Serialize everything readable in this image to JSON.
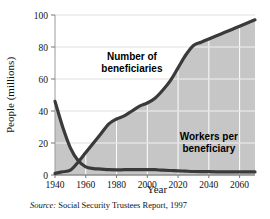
{
  "figure": {
    "source_prefix": "Source:",
    "source_text": "Social Security Trustees Report, 1997"
  },
  "colors": {
    "line": "#3a3a3a",
    "fill": "#c6c6c6",
    "grid": "#ffffff",
    "axis": "#9a9a9a",
    "text": "#111111"
  },
  "chart_data": {
    "type": "area",
    "title": "",
    "xlabel": "Year",
    "ylabel": "People (millions)",
    "xlim": [
      1940,
      2070
    ],
    "ylim": [
      0,
      100
    ],
    "xticks": [
      1940,
      1960,
      1980,
      2000,
      2020,
      2040,
      2060
    ],
    "yticks": [
      0,
      20,
      40,
      60,
      80,
      100
    ],
    "grid": true,
    "legend_position": "inline-annotations",
    "annotations": [
      {
        "text": "Number of beneficiaries",
        "line1": "Number of",
        "line2": "beneficiaries",
        "x": 1990,
        "y": 72
      },
      {
        "text": "Workers per beneficiary",
        "line1": "Workers per",
        "line2": "beneficiary",
        "x": 2040,
        "y": 22
      }
    ],
    "series": [
      {
        "name": "Number of beneficiaries",
        "x": [
          1940,
          1945,
          1950,
          1955,
          1960,
          1965,
          1970,
          1975,
          1980,
          1985,
          1990,
          1995,
          2000,
          2005,
          2010,
          2015,
          2020,
          2025,
          2030,
          2035,
          2040,
          2045,
          2050,
          2055,
          2060,
          2065,
          2070
        ],
        "values": [
          1,
          2,
          3,
          8,
          14,
          20,
          26,
          32,
          35,
          37,
          40,
          43,
          45,
          48,
          53,
          59,
          67,
          75,
          81,
          83,
          85,
          87,
          89,
          91,
          93,
          95,
          97
        ]
      },
      {
        "name": "Workers per beneficiary",
        "x": [
          1940,
          1945,
          1950,
          1955,
          1960,
          1965,
          1970,
          1975,
          1980,
          1985,
          1990,
          1995,
          2000,
          2005,
          2010,
          2015,
          2020,
          2025,
          2030,
          2035,
          2040,
          2045,
          2050,
          2055,
          2060,
          2065,
          2070
        ],
        "values": [
          46,
          30,
          17,
          9,
          5.1,
          4.0,
          3.7,
          3.3,
          3.2,
          3.3,
          3.4,
          3.3,
          3.4,
          3.3,
          3.0,
          2.8,
          2.6,
          2.4,
          2.2,
          2.1,
          2.1,
          2.0,
          2.0,
          2.0,
          2.0,
          1.9,
          1.9
        ]
      }
    ]
  }
}
